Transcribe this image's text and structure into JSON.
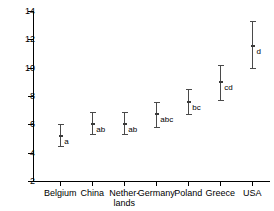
{
  "chart_data": {
    "type": "scatter",
    "title": "",
    "xlabel": "",
    "ylabel": "",
    "ylim": [
      2,
      14
    ],
    "yticks": [
      2,
      4,
      6,
      8,
      10,
      12,
      14
    ],
    "grid": false,
    "legend": "none",
    "categories": [
      "Belgium",
      "China",
      "Nether-\nlands",
      "Germany",
      "Poland",
      "Greece",
      "USA"
    ],
    "values": [
      5.2,
      6.0,
      6.0,
      6.7,
      7.6,
      9.0,
      11.5
    ],
    "error_low": [
      4.5,
      5.3,
      5.3,
      5.8,
      6.7,
      7.7,
      10.0
    ],
    "error_high": [
      6.0,
      6.9,
      6.9,
      7.6,
      8.5,
      10.2,
      13.3
    ],
    "annotations": [
      "a",
      "ab",
      "ab",
      "abc",
      "bc",
      "cd",
      "d"
    ],
    "points": [
      {
        "category": "Belgium",
        "label": "Belgium",
        "mean": 5.2,
        "low": 4.5,
        "high": 6.0,
        "group": "a"
      },
      {
        "category": "China",
        "label": "China",
        "mean": 6.0,
        "low": 5.3,
        "high": 6.9,
        "group": "ab"
      },
      {
        "category": "Netherlands",
        "label": "Nether-\nlands",
        "mean": 6.0,
        "low": 5.3,
        "high": 6.9,
        "group": "ab"
      },
      {
        "category": "Germany",
        "label": "Germany",
        "mean": 6.7,
        "low": 5.8,
        "high": 7.6,
        "group": "abc"
      },
      {
        "category": "Poland",
        "label": "Poland",
        "mean": 7.6,
        "low": 6.7,
        "high": 8.5,
        "group": "bc"
      },
      {
        "category": "Greece",
        "label": "Greece",
        "mean": 9.0,
        "low": 7.7,
        "high": 10.2,
        "group": "cd"
      },
      {
        "category": "USA",
        "label": "USA",
        "mean": 11.5,
        "low": 10.0,
        "high": 13.3,
        "group": "d"
      }
    ],
    "colors": {
      "axis": "#000000",
      "marker": "#3a3a3a",
      "errorbar": "#4a4a4a",
      "background": "#ffffff",
      "text": "#000000"
    }
  }
}
